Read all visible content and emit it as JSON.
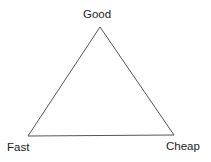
{
  "diagram": {
    "type": "triangle",
    "stroke_color": "#555555",
    "vertices": [
      {
        "label": "Good",
        "position": "top"
      },
      {
        "label": "Fast",
        "position": "bottom-left"
      },
      {
        "label": "Cheap",
        "position": "bottom-right"
      }
    ]
  }
}
